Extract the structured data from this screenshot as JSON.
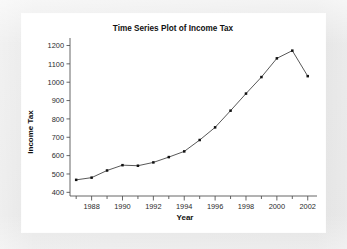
{
  "window": {
    "background_color": "#e9e9e9",
    "panel_color": "#ffffff"
  },
  "chart_data": {
    "type": "line",
    "title": "Time Series Plot of Income Tax",
    "xlabel": "Year",
    "ylabel": "Income Tax",
    "grid": false,
    "legend": null,
    "legend_position": "none",
    "series_color": "#111111",
    "marker": "filled-square",
    "xlim": [
      1986.6,
      2002.6
    ],
    "ylim": [
      380,
      1230
    ],
    "x_major_ticks": [
      1988,
      1990,
      1992,
      1994,
      1996,
      1998,
      2000,
      2002
    ],
    "x_major_tick_labels": [
      "1988",
      "1990",
      "1992",
      "1994",
      "1996",
      "1998",
      "2000",
      "2002"
    ],
    "x_minor_ticks": [
      1987,
      1989,
      1991,
      1993,
      1995,
      1997,
      1999,
      2001
    ],
    "y_ticks": [
      400,
      500,
      600,
      700,
      800,
      900,
      1000,
      1100,
      1200
    ],
    "y_tick_labels": [
      "400",
      "500",
      "600",
      "700",
      "800",
      "900",
      "1000",
      "1100",
      "1200"
    ],
    "x": [
      1987,
      1988,
      1989,
      1990,
      1991,
      1992,
      1993,
      1994,
      1995,
      1996,
      1997,
      1998,
      1999,
      2000,
      2001,
      2002
    ],
    "values": [
      468,
      480,
      519,
      548,
      545,
      563,
      592,
      623,
      685,
      754,
      845,
      938,
      1028,
      1130,
      1172,
      1033
    ],
    "points": [
      {
        "year": "1987",
        "value": 468
      },
      {
        "year": "1988",
        "value": 480
      },
      {
        "year": "1989",
        "value": 519
      },
      {
        "year": "1990",
        "value": 548
      },
      {
        "year": "1991",
        "value": 545
      },
      {
        "year": "1992",
        "value": 563
      },
      {
        "year": "1993",
        "value": 592
      },
      {
        "year": "1994",
        "value": 623
      },
      {
        "year": "1995",
        "value": 685
      },
      {
        "year": "1996",
        "value": 754
      },
      {
        "year": "1997",
        "value": 845
      },
      {
        "year": "1998",
        "value": 938
      },
      {
        "year": "1999",
        "value": 1028
      },
      {
        "year": "2000",
        "value": 1130
      },
      {
        "year": "2001",
        "value": 1172
      },
      {
        "year": "2002",
        "value": 1033
      }
    ]
  }
}
